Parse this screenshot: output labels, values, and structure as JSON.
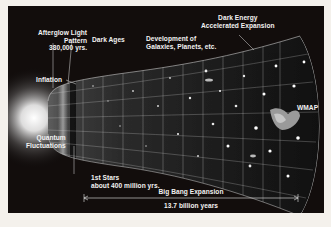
{
  "diagram": {
    "labels": {
      "afterglow": [
        "Afterglow Light",
        "Pattern",
        "380,000 yrs."
      ],
      "dark_ages": "Dark Ages",
      "development": [
        "Development of",
        "Galaxies, Planets, etc."
      ],
      "dark_energy": [
        "Dark Energy",
        "Accelerated Expansion"
      ],
      "inflation": "Inflation",
      "quantum": [
        "Quantum",
        "Fluctuations"
      ],
      "first_stars": [
        "1st Stars",
        "about 400 million yrs."
      ],
      "wmap": "WMAP",
      "expansion": "Big Bang Expansion",
      "duration": "13.7 billion years"
    },
    "colors": {
      "background": "#120d0c",
      "border": "#f4f1ec",
      "text": "#f2f2f2",
      "grid": "#d8d8d8"
    }
  }
}
